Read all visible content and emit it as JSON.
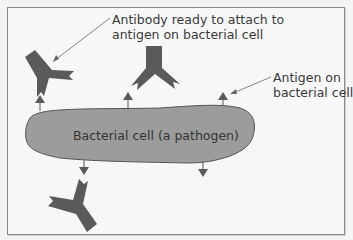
{
  "diagram": {
    "labels": {
      "antibody_line1": "Antibody ready to attach to",
      "antibody_line2": "antigen on bacterial cell",
      "antigen_line1": "Antigen on",
      "antigen_line2": "bacterial cell",
      "cell": "Bacterial cell (a pathogen)"
    },
    "colors": {
      "background": "#f7f7f7",
      "border": "#8a8a8a",
      "cell_fill": "#9c9c9c",
      "cell_stroke": "#555555",
      "antibody_fill": "#5a5a5a",
      "antigen_fill": "#5a5a5a",
      "text": "#3a3a3a"
    },
    "elements": {
      "antibodies": 3,
      "antigens": 5
    }
  }
}
